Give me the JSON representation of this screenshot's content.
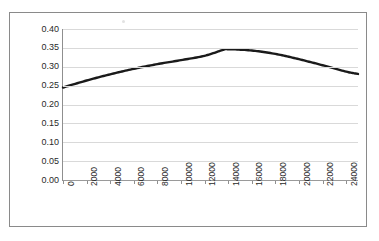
{
  "chart_data": {
    "type": "line",
    "title": "",
    "xlabel": "",
    "ylabel": "Predicted Probability",
    "xlim": [
      0,
      25000
    ],
    "ylim": [
      0.0,
      0.4
    ],
    "grid": true,
    "legend": false,
    "y_ticks": [
      "0.40",
      "0.35",
      "0.30",
      "0.25",
      "0.20",
      "0.15",
      "0.10",
      "0.05",
      "0.00"
    ],
    "y_tick_values": [
      0.4,
      0.35,
      0.3,
      0.25,
      0.2,
      0.15,
      0.1,
      0.05,
      0.0
    ],
    "x_ticks": [
      "0",
      "2000",
      "4000",
      "6000",
      "8000",
      "10000",
      "12000",
      "14000",
      "16000",
      "18000",
      "20000",
      "22000",
      "24000"
    ],
    "x_tick_values": [
      0,
      2000,
      4000,
      6000,
      8000,
      10000,
      12000,
      14000,
      16000,
      18000,
      20000,
      22000,
      24000
    ],
    "series": [
      {
        "name": "Predicted Probability",
        "color": "#1a1a1a",
        "x": [
          0,
          1000,
          2000,
          3000,
          4000,
          5000,
          6000,
          7000,
          8000,
          9000,
          10000,
          11000,
          12000,
          13000,
          13500,
          14000,
          15000,
          16000,
          17000,
          18000,
          19000,
          20000,
          21000,
          22000,
          23000,
          24000,
          25000
        ],
        "values": [
          0.245,
          0.2545,
          0.2635,
          0.272,
          0.28,
          0.2875,
          0.2945,
          0.301,
          0.307,
          0.3125,
          0.3175,
          0.322,
          0.326,
          0.3295,
          0.331,
          0.3325,
          0.335,
          0.337,
          0.3385,
          0.3395,
          0.34,
          0.34,
          0.3395,
          0.3385,
          0.337,
          0.335,
          0.3325
        ]
      }
    ],
    "curve_points_px": [
      [
        0,
        0.245
      ],
      [
        2000,
        0.2635
      ],
      [
        4000,
        0.28
      ],
      [
        6000,
        0.2945
      ],
      [
        8000,
        0.307
      ],
      [
        10000,
        0.3175
      ],
      [
        12000,
        0.329
      ],
      [
        13500,
        0.344
      ],
      [
        14000,
        0.3465
      ],
      [
        16000,
        0.343
      ],
      [
        18000,
        0.334
      ],
      [
        20000,
        0.32
      ],
      [
        22000,
        0.304
      ],
      [
        24000,
        0.287
      ],
      [
        25000,
        0.281
      ]
    ],
    "peak": {
      "x": 13800,
      "y": 0.347
    },
    "start": {
      "x": 0,
      "y": 0.245
    },
    "end": {
      "x": 25000,
      "y": 0.281
    }
  },
  "axis": {
    "y_title": "Predicted Probability"
  },
  "colors": {
    "curve": "#1a1a1a",
    "grid": "#d9d9d9",
    "axis": "#8f8f8f",
    "frame": "#8a8a8a",
    "text": "#2a2a2a",
    "background": "#ffffff"
  }
}
